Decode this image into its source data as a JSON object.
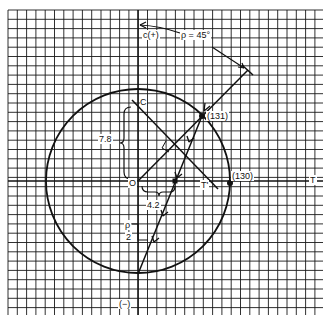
{
  "diagram": {
    "type": "mohr-circle-construction",
    "grid": {
      "x0": 8,
      "y0": 10,
      "x1": 323,
      "y1": 315,
      "spacing": 9.3,
      "color": "#1a1a1a"
    },
    "circle": {
      "cx": 138,
      "cy": 181,
      "r": 92
    },
    "labels": {
      "c_plus": "c(+)",
      "rho": "ρ = 45°",
      "point_131": "(131)",
      "point_130": "(130)",
      "axis_t": "T",
      "axis_c": "C",
      "t_prime": "T'",
      "origin": "O",
      "dim_78": "7.8",
      "dim_42": "4.2",
      "rho_half_num": "ρ",
      "rho_half_den": "2",
      "c_minus": "(−)"
    },
    "points": {
      "origin": [
        138,
        181
      ],
      "p131": [
        202,
        116
      ],
      "p130": [
        230,
        183
      ],
      "intersection": [
        174,
        145
      ],
      "mid_point": [
        175,
        181
      ],
      "bottom": [
        138,
        274
      ],
      "ray_end": [
        248,
        70
      ]
    },
    "ink_color": "#111111"
  }
}
